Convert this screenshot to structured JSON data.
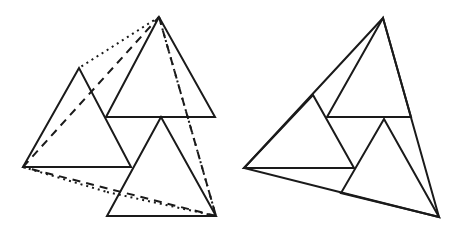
{
  "figure": {
    "stroke_color": "#1a1a1a",
    "background": "#ffffff",
    "left": {
      "triangles": [
        {
          "name": "top-triangle",
          "points": [
            [
              159,
              17
            ],
            [
              106,
              117
            ],
            [
              215,
              117
            ]
          ]
        },
        {
          "name": "left-triangle",
          "points": [
            [
              79,
              68
            ],
            [
              23,
              167
            ],
            [
              131,
              167
            ]
          ]
        },
        {
          "name": "bottom-triangle",
          "points": [
            [
              161,
              117
            ],
            [
              107,
              216
            ],
            [
              216,
              216
            ]
          ]
        }
      ],
      "dashed_lines": [
        [
          [
            23,
            167
          ],
          [
            159,
            17
          ]
        ],
        [
          [
            159,
            17
          ],
          [
            216,
            216
          ]
        ],
        [
          [
            216,
            216
          ],
          [
            23,
            167
          ]
        ]
      ],
      "dotted_lines": [
        [
          [
            159,
            17
          ],
          [
            93,
            90
          ]
        ],
        [
          [
            23,
            167
          ],
          [
            118,
            192
          ]
        ],
        [
          [
            186,
            117
          ],
          [
            216,
            216
          ]
        ]
      ]
    },
    "right": {
      "outer": [
        [
          383,
          18
        ],
        [
          244,
          168
        ],
        [
          439,
          217
        ]
      ],
      "triangles": [
        {
          "name": "inner-top",
          "points": [
            [
              383,
              18
            ],
            [
              327,
              117
            ],
            [
              411,
              117
            ]
          ]
        },
        {
          "name": "inner-left",
          "points": [
            [
              313,
              95
            ],
            [
              244,
              168
            ],
            [
              354,
              168
            ]
          ]
        },
        {
          "name": "inner-bottom",
          "points": [
            [
              384,
              119
            ],
            [
              341,
              193
            ],
            [
              439,
              217
            ]
          ]
        }
      ]
    }
  }
}
